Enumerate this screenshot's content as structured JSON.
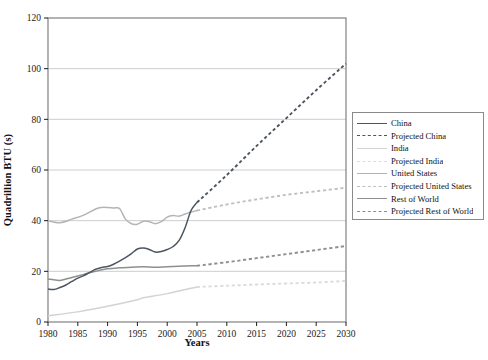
{
  "chart_data": {
    "type": "line",
    "title": "",
    "xlabel": "Years",
    "ylabel": "Quadrillion BTU (s)",
    "xlim": [
      1980,
      2030
    ],
    "ylim": [
      0,
      120
    ],
    "xticks": [
      1980,
      1985,
      1990,
      1995,
      2000,
      2005,
      2010,
      2015,
      2020,
      2025,
      2030
    ],
    "yticks": [
      0,
      20,
      40,
      60,
      80,
      100,
      120
    ],
    "grid": "horizontal",
    "legend_position": "right",
    "x": [
      1980,
      1981,
      1982,
      1983,
      1984,
      1985,
      1986,
      1987,
      1988,
      1989,
      1990,
      1991,
      1992,
      1993,
      1994,
      1995,
      1996,
      1997,
      1998,
      1999,
      2000,
      2001,
      2002,
      2003,
      2004,
      2005,
      2010,
      2015,
      2020,
      2025,
      2030
    ],
    "series": [
      {
        "name": "China",
        "style": "solid",
        "color": "#4c5560",
        "x": [
          1980,
          1981,
          1982,
          1983,
          1984,
          1985,
          1986,
          1987,
          1988,
          1989,
          1990,
          1991,
          1992,
          1993,
          1994,
          1995,
          1996,
          1997,
          1998,
          1999,
          2000,
          2001,
          2002,
          2003,
          2004,
          2005
        ],
        "values": [
          13.0,
          12.8,
          13.6,
          14.6,
          16.0,
          17.3,
          18.3,
          19.6,
          20.8,
          21.5,
          21.9,
          22.8,
          24.0,
          25.4,
          27.0,
          28.8,
          29.2,
          28.6,
          27.6,
          27.8,
          28.6,
          29.8,
          32.2,
          37.2,
          44.0,
          47.2
        ]
      },
      {
        "name": "Projected China",
        "style": "dashed",
        "color": "#4c5560",
        "x": [
          2005,
          2010,
          2015,
          2020,
          2025,
          2030
        ],
        "values": [
          47.2,
          58.0,
          69.5,
          80.5,
          91.5,
          102.0
        ]
      },
      {
        "name": "India",
        "style": "solid",
        "color": "#d3d3d3",
        "x": [
          1980,
          1985,
          1990,
          1995,
          1996,
          2000,
          2005
        ],
        "values": [
          2.5,
          4.0,
          6.2,
          8.8,
          9.6,
          11.2,
          13.8
        ]
      },
      {
        "name": "Projected India",
        "style": "dashed",
        "color": "#dcdcdc",
        "x": [
          2005,
          2010,
          2015,
          2020,
          2025,
          2030
        ],
        "values": [
          13.8,
          14.3,
          14.8,
          15.2,
          15.6,
          16.2
        ]
      },
      {
        "name": "United States",
        "style": "solid",
        "color": "#b4b4b4",
        "x": [
          1980,
          1982,
          1984,
          1986,
          1988,
          1989,
          1990,
          1991,
          1992,
          1993,
          1994,
          1995,
          1996,
          1997,
          1998,
          1999,
          2000,
          2001,
          2002,
          2003,
          2004,
          2005
        ],
        "values": [
          40.0,
          39.2,
          40.6,
          42.2,
          44.6,
          45.2,
          45.2,
          45.0,
          44.8,
          40.6,
          38.8,
          38.6,
          39.8,
          39.6,
          38.8,
          39.6,
          41.4,
          42.0,
          41.8,
          42.6,
          43.4,
          44.0
        ]
      },
      {
        "name": "Projected United States",
        "style": "dashed",
        "color": "#c0c0c0",
        "x": [
          2005,
          2010,
          2015,
          2020,
          2025,
          2030
        ],
        "values": [
          44.0,
          46.4,
          48.4,
          50.2,
          51.6,
          53.0
        ]
      },
      {
        "name": "Rest of World",
        "style": "solid",
        "color": "#8f8f8f",
        "x": [
          1980,
          1982,
          1984,
          1986,
          1988,
          1990,
          1992,
          1994,
          1996,
          1998,
          2000,
          2002,
          2004,
          2005
        ],
        "values": [
          17.0,
          16.4,
          17.6,
          18.8,
          20.0,
          21.0,
          21.4,
          21.6,
          21.8,
          21.6,
          21.8,
          22.0,
          22.2,
          22.2
        ]
      },
      {
        "name": "Projected Rest of World",
        "style": "dashed",
        "color": "#8f8f8f",
        "x": [
          2005,
          2010,
          2015,
          2020,
          2025,
          2030
        ],
        "values": [
          22.2,
          23.6,
          25.2,
          26.8,
          28.4,
          30.0
        ]
      }
    ]
  },
  "legend": {
    "items": [
      {
        "label": "China",
        "color": "#4c5560",
        "style": "solid"
      },
      {
        "label": "Projected China",
        "color": "#4c5560",
        "style": "dashed"
      },
      {
        "label": "India",
        "color": "#d3d3d3",
        "style": "solid"
      },
      {
        "label": "Projected India",
        "color": "#dcdcdc",
        "style": "dashed"
      },
      {
        "label": "United States",
        "color": "#b4b4b4",
        "style": "solid"
      },
      {
        "label": "Projected United States",
        "color": "#c0c0c0",
        "style": "dashed"
      },
      {
        "label": "Rest of World",
        "color": "#8f8f8f",
        "style": "solid"
      },
      {
        "label": "Projected Rest of World",
        "color": "#8f8f8f",
        "style": "dashed"
      }
    ]
  },
  "caption": ""
}
